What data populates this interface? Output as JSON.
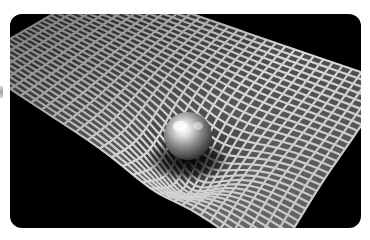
{
  "image": {
    "description": "Grayscale 3D rendering of a square mesh grid warped into a funnel-shaped depression by a shiny sphere, illustrating spacetime curvature",
    "subject": "gravity-well",
    "colors": {
      "background": "#ffffff",
      "backdrop": "#000000",
      "grid_line": "#d8d8d8",
      "grid_cell": "#4a4a4a",
      "sphere_highlight": "#f2f2f2",
      "sphere_shadow": "#1a1a1a"
    }
  }
}
